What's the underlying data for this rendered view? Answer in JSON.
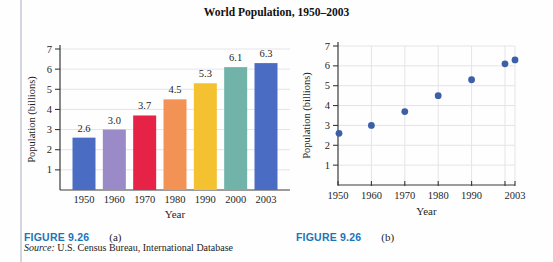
{
  "page": {
    "title": "World Population, 1950–2003",
    "source_label": "Source:",
    "source_text": " U.S. Census Bureau, International Database"
  },
  "figure_a": {
    "label": "FIGURE 9.26",
    "sublabel": "(a)"
  },
  "figure_b": {
    "label": "FIGURE 9.26",
    "sublabel": "(b)"
  },
  "colors": {
    "figure_label_blue": "#1d74b8",
    "axis": "#3a3a3a",
    "grid": "#e5e3e7",
    "text": "#1f1f1f",
    "point_blue": "#3c5fa6",
    "margin_rule": "#d3d6de"
  },
  "chart_data": [
    {
      "type": "bar",
      "title": "World Population, 1950–2003",
      "categories": [
        "1950",
        "1960",
        "1970",
        "1980",
        "1990",
        "2000",
        "2003"
      ],
      "values": [
        2.6,
        3.0,
        3.7,
        4.5,
        5.3,
        6.1,
        6.3
      ],
      "data_labels": [
        "2.6",
        "3.0",
        "3.7",
        "4.5",
        "5.3",
        "6.1",
        "6.3"
      ],
      "bar_colors": [
        "#4a6cc3",
        "#9b8ac8",
        "#e62346",
        "#f29254",
        "#f4c131",
        "#71b3a8",
        "#4a6cc3"
      ],
      "xlabel": "Year",
      "ylabel": "Population (billions)",
      "yticks": [
        1,
        2,
        3,
        4,
        5,
        6,
        7
      ],
      "ylim": [
        0,
        7
      ],
      "grid": true
    },
    {
      "type": "scatter",
      "x": [
        1950,
        1960,
        1970,
        1980,
        1990,
        2000,
        2003
      ],
      "y": [
        2.6,
        3.0,
        3.7,
        4.5,
        5.3,
        6.1,
        6.3
      ],
      "xlabel": "Year",
      "ylabel": "Population (billions)",
      "xticks": [
        1950,
        1960,
        1970,
        1980,
        1990,
        2000,
        2003
      ],
      "xtick_labels": [
        "1950",
        "1960",
        "1970",
        "1980",
        "1990",
        "",
        "2003"
      ],
      "yticks": [
        1,
        2,
        3,
        4,
        5,
        6,
        7
      ],
      "xlim": [
        1950,
        2003
      ],
      "ylim": [
        0,
        7
      ],
      "grid": true,
      "point_color": "#3c5fa6"
    }
  ]
}
